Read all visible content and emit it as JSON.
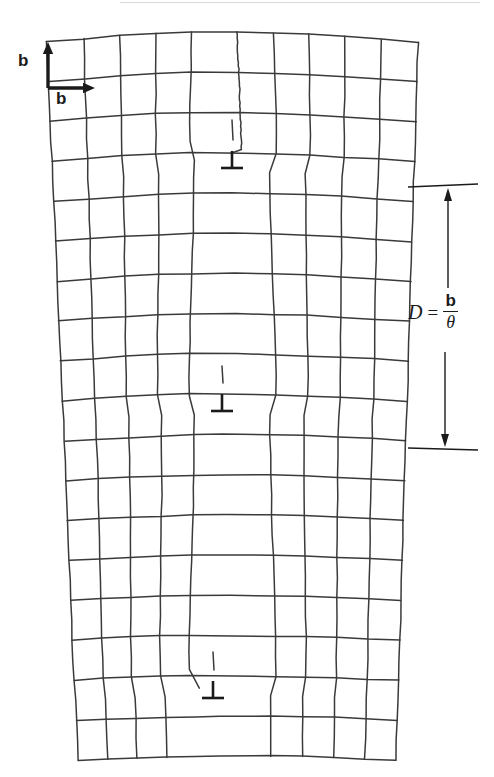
{
  "figure": {
    "width": 494,
    "height": 777,
    "background_color": "#ffffff",
    "line_color": "#3a3a3a",
    "ink_color": "#1a1a1a"
  },
  "burgers_vectors": {
    "vertical": {
      "label": "b",
      "description": "vertical Burgers vector arrow at upper-left corner of lattice",
      "arrow_tail": [
        48,
        88
      ],
      "arrow_head": [
        48,
        42
      ]
    },
    "horizontal": {
      "label": "b",
      "description": "horizontal Burgers vector arrow at upper-left corner of lattice",
      "arrow_tail": [
        48,
        88
      ],
      "arrow_head": [
        95,
        88
      ]
    }
  },
  "spacing_annotation": {
    "symbol": "D",
    "equals": "=",
    "numerator": "b",
    "denominator": "θ",
    "full_text": "D = b/θ",
    "dimension_line_x": 448,
    "top_y": 187,
    "bottom_y": 448,
    "tick_left_x": 408,
    "tick_right_x": 478
  },
  "dislocations": [
    {
      "name": "dislocation-top",
      "symbol": "⊥",
      "x": 232,
      "y": 162,
      "half_plane_top_y": 120
    },
    {
      "name": "dislocation-middle",
      "symbol": "⊥",
      "x": 222,
      "y": 405,
      "half_plane_top_y": 366
    },
    {
      "name": "dislocation-bottom",
      "symbol": "⊥",
      "x": 213,
      "y": 692,
      "half_plane_top_y": 652
    }
  ],
  "lattice": {
    "description": "wedge-shaped distorted square lattice with three extra half-planes",
    "rows": 18,
    "columns": 10,
    "top_edge": {
      "left_x": 47,
      "right_x": 418,
      "y": 42,
      "arc_rise": 10
    },
    "bottom_edge": {
      "left_x": 78,
      "right_x": 396,
      "y": 760,
      "arc_rise": 4
    },
    "left_edge_slant": 31,
    "right_edge_slant": -22,
    "line_width": 1.5
  }
}
